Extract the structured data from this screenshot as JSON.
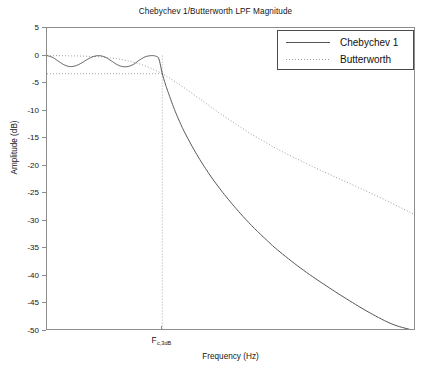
{
  "chart_data": {
    "type": "line",
    "title": "Chebychev 1/Butterworth LPF Magnitude",
    "xlabel": "Frequency (Hz)",
    "ylabel": "Amplitude (dB)",
    "ylim": [
      -50,
      5
    ],
    "xlim": [
      0,
      3.2
    ],
    "grid": false,
    "legend_position": "top-right",
    "y_ticks": [
      5,
      0,
      -5,
      -10,
      -15,
      -20,
      -25,
      -30,
      -35,
      -40,
      -45,
      -50
    ],
    "y_tick_labels": [
      "5",
      "0",
      "-5",
      "-10",
      "-15",
      "-20",
      "-25",
      "-30",
      "-35",
      "-40",
      "-45",
      "-50"
    ],
    "x_ticks": [
      1.0
    ],
    "x_tick_labels": [
      "F"
    ],
    "x_tick_label_subscript": "c,3dB",
    "reference_lines": [
      {
        "name": "minus-3db-line",
        "orientation": "horizontal",
        "value": -3.3,
        "style": "dotted"
      },
      {
        "name": "cutoff-frequency-line",
        "orientation": "vertical",
        "value": 1.0,
        "style": "dotted"
      }
    ],
    "series": [
      {
        "name": "Chebychev 1",
        "style": "solid",
        "color": "#555555",
        "x": [
          0.0,
          0.05,
          0.1,
          0.15,
          0.2,
          0.25,
          0.3,
          0.35,
          0.4,
          0.45,
          0.5,
          0.55,
          0.6,
          0.65,
          0.7,
          0.75,
          0.8,
          0.85,
          0.9,
          0.94,
          0.97,
          1.0,
          1.03,
          1.06,
          1.1,
          1.15,
          1.2,
          1.3,
          1.4,
          1.5,
          1.6,
          1.7,
          1.8,
          1.9,
          2.0,
          2.2,
          2.4,
          2.6,
          2.8,
          3.0,
          3.2
        ],
        "y": [
          0.0,
          -0.35,
          -1.05,
          -1.7,
          -2.0,
          -1.85,
          -1.35,
          -0.7,
          -0.2,
          -0.02,
          -0.25,
          -0.85,
          -1.55,
          -1.98,
          -2.0,
          -1.6,
          -0.85,
          -0.25,
          -0.02,
          -0.1,
          -0.6,
          -3.3,
          -5.4,
          -7.2,
          -9.5,
          -12.0,
          -14.2,
          -18.0,
          -21.3,
          -24.2,
          -26.8,
          -29.2,
          -31.4,
          -33.4,
          -35.3,
          -38.6,
          -41.5,
          -44.2,
          -46.7,
          -48.8,
          -50.0
        ]
      },
      {
        "name": "Butterworth",
        "style": "dotted",
        "color": "#9a9a9a",
        "x": [
          0.0,
          0.1,
          0.2,
          0.3,
          0.4,
          0.5,
          0.6,
          0.7,
          0.8,
          0.9,
          1.0,
          1.1,
          1.2,
          1.3,
          1.4,
          1.5,
          1.6,
          1.7,
          1.8,
          1.9,
          2.0,
          2.2,
          2.4,
          2.6,
          2.8,
          3.0,
          3.2
        ],
        "y": [
          0.0,
          -0.02,
          -0.05,
          -0.1,
          -0.18,
          -0.32,
          -0.55,
          -0.95,
          -1.5,
          -2.3,
          -3.3,
          -4.6,
          -6.0,
          -7.5,
          -9.0,
          -10.5,
          -11.9,
          -13.3,
          -14.6,
          -15.8,
          -17.0,
          -19.1,
          -21.1,
          -23.0,
          -24.9,
          -26.9,
          -29.0
        ]
      }
    ]
  },
  "legend": {
    "entries": [
      {
        "label": "Chebychev 1",
        "icon": "solid-line-icon"
      },
      {
        "label": "Butterworth",
        "icon": "dotted-line-icon"
      }
    ]
  }
}
